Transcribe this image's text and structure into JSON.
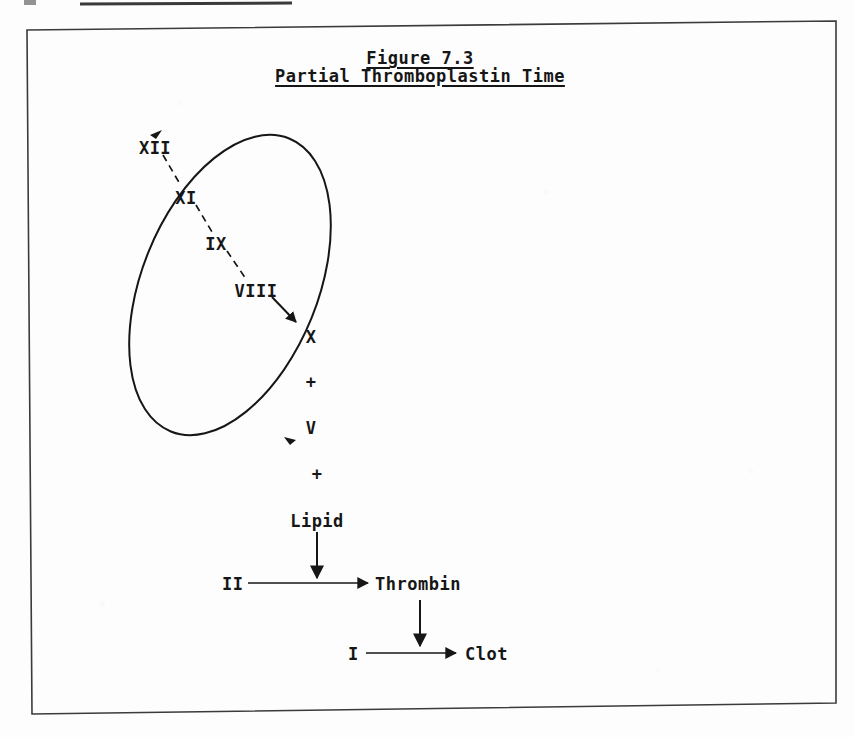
{
  "page": {
    "width": 854,
    "height": 737,
    "background_color": "#fdfdfd",
    "ink_color": "#161616",
    "frame_color": "#3b3b3b"
  },
  "scan_artifact": {
    "top_rule_present": true,
    "description": "dark horizontal line from cropped header above the figure frame"
  },
  "title": {
    "line1": "Figure 7.3",
    "line2": "Partial Thromboplastin Time",
    "underlined": true
  },
  "intrinsic_pathway": {
    "enclosed_by_ellipse": true,
    "cascade": [
      {
        "label": "XII",
        "x": 155,
        "y": 147
      },
      {
        "label": "XI",
        "x": 186,
        "y": 197
      },
      {
        "label": "IX",
        "x": 216,
        "y": 243
      },
      {
        "label": "VIII",
        "x": 253,
        "y": 290
      },
      {
        "label": "X",
        "x": 311,
        "y": 336
      },
      {
        "label": "+",
        "x": 311,
        "y": 381
      },
      {
        "label": "V",
        "x": 311,
        "y": 427
      }
    ],
    "dashed_links": [
      {
        "from": "XII",
        "to": "XI"
      },
      {
        "from": "XI",
        "to": "IX"
      },
      {
        "from": "IX",
        "to": "VIII"
      }
    ],
    "solid_arrows": [
      {
        "from": "VIII",
        "to": "X"
      }
    ]
  },
  "common_pathway": {
    "plus": "+",
    "lipid": "Lipid",
    "prothrombin": "II",
    "thrombin": "Thrombin",
    "fibrinogen": "I",
    "clot": "Clot",
    "arrows": [
      {
        "name": "lipid-down-arrow",
        "from": "Lipid",
        "to": "II-to-Thrombin line"
      },
      {
        "name": "prothrombin-to-thrombin-arrow",
        "from": "II",
        "to": "Thrombin"
      },
      {
        "name": "thrombin-down-arrow",
        "from": "Thrombin",
        "to": "I-to-Clot line"
      },
      {
        "name": "fibrinogen-to-clot-arrow",
        "from": "I",
        "to": "Clot"
      }
    ]
  }
}
